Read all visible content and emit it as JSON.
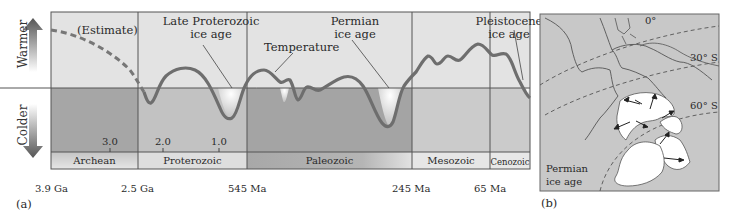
{
  "panel_a": {
    "label": "(a)",
    "y_axis": {
      "warmer": "Warmer",
      "colder": "Colder"
    },
    "annotations": {
      "estimate": "(Estimate)",
      "late_proterozoic_line1": "Late Proterozoic",
      "late_proterozoic_line2": "ice age",
      "temperature": "Temperature",
      "permian_line1": "Permian",
      "permian_line2": "ice age",
      "pleistocene_line1": "Pleistocene",
      "pleistocene_line2": "ice age"
    },
    "ticks": [
      "3.0",
      "2.0",
      "1.0"
    ],
    "eras": [
      "Archean",
      "Proterozoic",
      "Paleozoic",
      "Mesozoic",
      "Cenozoic"
    ],
    "boundaries": [
      "3.9 Ga",
      "2.5 Ga",
      "545 Ma",
      "245 Ma",
      "65 Ma"
    ]
  },
  "panel_b": {
    "label": "(b)",
    "latitudes": [
      "0°",
      "30° S",
      "60° S"
    ],
    "caption_line1": "Permian",
    "caption_line2": "ice age"
  },
  "colors": {
    "warm_bg": "#e4e4e4",
    "cold_bg": "#b9b9b9",
    "cold_bg_dark": "#a3a3a3",
    "curve": "#6f6f6f",
    "ice": "#ffffff",
    "land_bg": "#c9c9c9"
  }
}
